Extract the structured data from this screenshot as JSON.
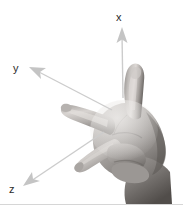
{
  "figure": {
    "background_color": "#ffffff",
    "width": 183,
    "height": 212,
    "divider_color": "#d6d6d6"
  },
  "axes": {
    "arrow_color": "#c9c9c9",
    "arrow_color_dark": "#b0b0b0",
    "label_color": "#2b2b2b",
    "items": [
      {
        "id": "x",
        "label": "x",
        "direction": "up",
        "maps_to_digit": "thumb",
        "tip": [
          122,
          28
        ],
        "tail": [
          123,
          98
        ]
      },
      {
        "id": "y",
        "label": "y",
        "direction": "up-left",
        "maps_to_digit": "index-finger",
        "tip": [
          31,
          68
        ],
        "tail": [
          112,
          110
        ]
      },
      {
        "id": "z",
        "label": "z",
        "direction": "down-left",
        "maps_to_digit": "middle-finger",
        "tip": [
          24,
          185
        ],
        "tail": [
          104,
          132
        ]
      }
    ]
  },
  "hand": {
    "alt": "grayscale photograph of a right hand with thumb up, index finger extended left and middle finger extended down-left",
    "handedness": "right",
    "skin_tone_light": "#e8e6e4",
    "skin_tone_mid": "#b9b5b2",
    "skin_tone_dark": "#6f6b68",
    "skin_tone_shadow": "#4a4745"
  }
}
